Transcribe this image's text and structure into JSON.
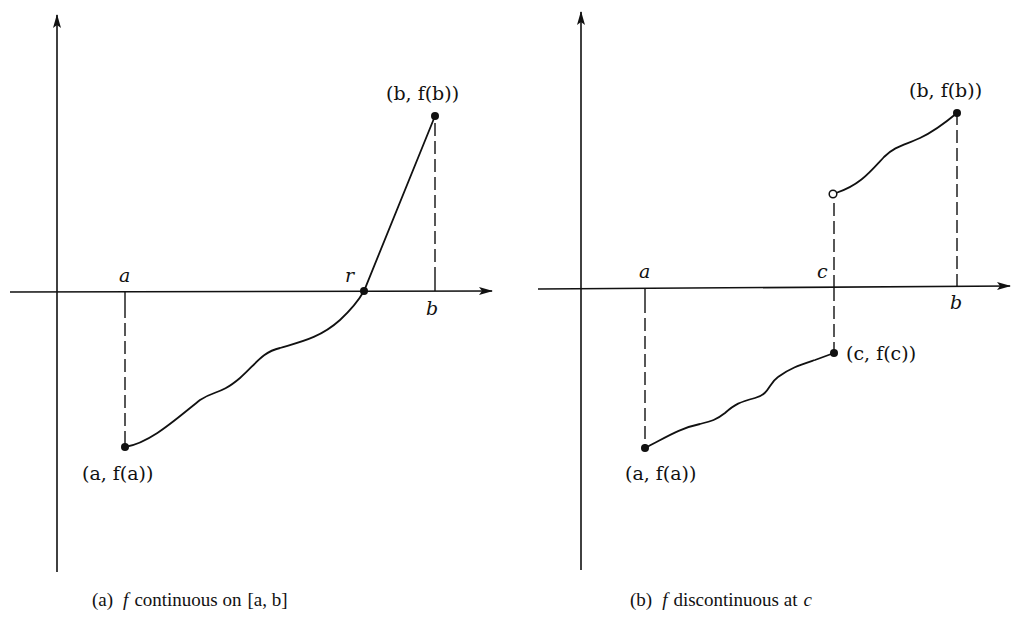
{
  "figure": {
    "panels": [
      {
        "id": "a",
        "caption": {
          "prefix": "(a)",
          "f": "f",
          "text": "continuous on",
          "interval": "[a, b]"
        },
        "labels": {
          "a": "a",
          "r": "r",
          "b": "b",
          "point_b": "(b, f(b))",
          "point_a": "(a, f(a))"
        },
        "points": [
          {
            "name": "(a, f(a))",
            "filled": true
          },
          {
            "name": "r",
            "filled": true
          },
          {
            "name": "(b, f(b))",
            "filled": true
          }
        ]
      },
      {
        "id": "b",
        "caption": {
          "prefix": "(b)",
          "f": "f",
          "text": "discontinuous at",
          "at": "c"
        },
        "labels": {
          "a": "a",
          "c": "c",
          "b": "b",
          "point_b": "(b, f(b))",
          "point_c": "(c, f(c))",
          "point_a": "(a, f(a))"
        },
        "points": [
          {
            "name": "(a, f(a))",
            "filled": true
          },
          {
            "name": "(c, f(c))",
            "filled": true
          },
          {
            "name": "limit from right at c",
            "filled": false
          },
          {
            "name": "(b, f(b))",
            "filled": true
          }
        ]
      }
    ],
    "colors": {
      "ink": "#111111",
      "background": "#ffffff"
    }
  }
}
